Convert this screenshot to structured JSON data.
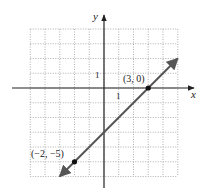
{
  "chart_data": {
    "type": "line",
    "title": "",
    "xlabel": "x",
    "ylabel": "y",
    "xlim": [
      -5,
      5
    ],
    "ylim": [
      -6,
      4
    ],
    "grid": true,
    "grid_style": "dotted",
    "axis_tick_labels": {
      "x_unit": "1",
      "y_unit": "1"
    },
    "series": [
      {
        "name": "line",
        "equation": "y = x - 3",
        "slope": 1,
        "y_intercept": -3,
        "arrows": "both",
        "x": [
          -3,
          5
        ],
        "y": [
          -6,
          2
        ],
        "color": "#555555"
      }
    ],
    "points": [
      {
        "label": "(3, 0)",
        "x": 3,
        "y": 0
      },
      {
        "label": "(−2, −5)",
        "x": -2,
        "y": -5
      }
    ]
  },
  "labels": {
    "x_axis": "x",
    "y_axis": "y",
    "x_unit": "1",
    "y_unit": "1",
    "point_a": "(3, 0)",
    "point_b": "(−2, −5)"
  }
}
